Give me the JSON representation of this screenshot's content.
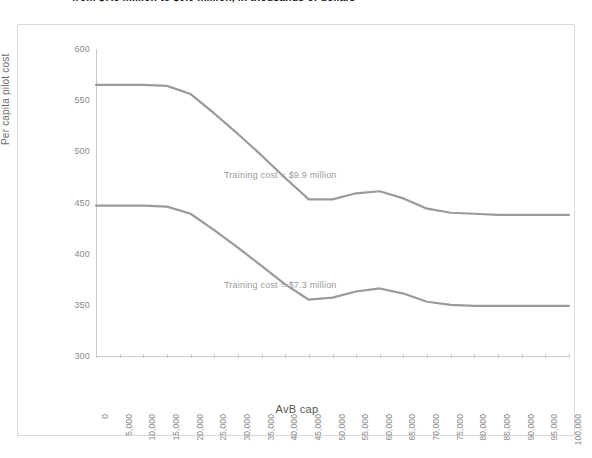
{
  "caption": {
    "text": "from $7.3 million to $9.9 million, in thousands of dollars"
  },
  "chart_data": {
    "type": "line",
    "title": "",
    "xlabel": "AvB  cap",
    "ylabel": "Per capita pilot cost",
    "xlim": [
      0,
      100000
    ],
    "ylim": [
      300,
      600
    ],
    "grid": false,
    "legend_position": "inline-annotation",
    "x_tick_labels": [
      "0",
      "5,000",
      "10,000",
      "15,000",
      "20,000",
      "25,000",
      "30,000",
      "35,000",
      "40,000",
      "45,000",
      "50,000",
      "55,000",
      "60,000",
      "65,000",
      "70,000",
      "75,000",
      "80,000",
      "85,000",
      "90,000",
      "95,000",
      "100,000"
    ],
    "y_tick_labels": [
      "600",
      "550",
      "500",
      "450",
      "400",
      "350",
      "300"
    ],
    "y_ticks": [
      600,
      550,
      500,
      450,
      400,
      350,
      300
    ],
    "x": [
      0,
      5000,
      10000,
      15000,
      20000,
      25000,
      30000,
      35000,
      40000,
      45000,
      50000,
      55000,
      60000,
      65000,
      70000,
      75000,
      80000,
      85000,
      90000,
      95000,
      100000
    ],
    "series": [
      {
        "name": "Training cost = $9.9 million",
        "color": "#9a9a9a",
        "values": [
          565,
          565,
          565,
          564,
          556,
          537,
          517,
          496,
          474,
          453,
          453,
          459,
          461,
          454,
          444,
          440,
          439,
          438,
          438,
          438,
          438
        ]
      },
      {
        "name": "Training cost = $7.3 million",
        "color": "#9a9a9a",
        "values": [
          447,
          447,
          447,
          446,
          439,
          423,
          406,
          388,
          370,
          355,
          357,
          363,
          366,
          361,
          353,
          350,
          349,
          349,
          349,
          349,
          349
        ]
      }
    ],
    "annotations": [
      {
        "text": "Training cost = $9.9 million",
        "x": 35000,
        "y": 468
      },
      {
        "text": "Training cost = $7.3 million",
        "x": 35000,
        "y": 360
      }
    ]
  },
  "colors": {
    "line": "#9a9a9a",
    "axis": "#c9c9c9",
    "tick_text": "#8a8a8a",
    "frame": "#d8d8d8"
  }
}
